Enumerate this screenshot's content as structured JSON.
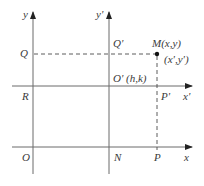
{
  "diagram": {
    "colors": {
      "axis": "#6a6a6a",
      "dashed": "#4a4a4a",
      "point": "#111111",
      "text": "#3a3a3a"
    },
    "axes": {
      "original": {
        "x_label": "x",
        "y_label": "y",
        "origin_label": "O"
      },
      "translated": {
        "x_label": "x'",
        "y_label": "y'",
        "origin_label": "O' (h,k)"
      }
    },
    "point": {
      "label": "M(x,y)",
      "alt_label": "(x',y')"
    },
    "labels": {
      "Q": "Q",
      "Q_prime": "Q'",
      "R": "R",
      "P_prime": "P'",
      "N": "N",
      "P": "P"
    }
  }
}
